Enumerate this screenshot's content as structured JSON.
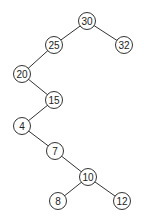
{
  "diagram": {
    "type": "binary-tree",
    "nodes": [
      {
        "id": "n30",
        "label": "30",
        "x": 87,
        "y": 21
      },
      {
        "id": "n25",
        "label": "25",
        "x": 54,
        "y": 45
      },
      {
        "id": "n32",
        "label": "32",
        "x": 124,
        "y": 45
      },
      {
        "id": "n20",
        "label": "20",
        "x": 22,
        "y": 74
      },
      {
        "id": "n15",
        "label": "15",
        "x": 54,
        "y": 100
      },
      {
        "id": "n4",
        "label": "4",
        "x": 22,
        "y": 126
      },
      {
        "id": "n7",
        "label": "7",
        "x": 55,
        "y": 151
      },
      {
        "id": "n10",
        "label": "10",
        "x": 88,
        "y": 177
      },
      {
        "id": "n8",
        "label": "8",
        "x": 58,
        "y": 201
      },
      {
        "id": "n12",
        "label": "12",
        "x": 122,
        "y": 201
      }
    ],
    "edges": [
      [
        "n30",
        "n25"
      ],
      [
        "n30",
        "n32"
      ],
      [
        "n25",
        "n20"
      ],
      [
        "n20",
        "n15"
      ],
      [
        "n15",
        "n4"
      ],
      [
        "n4",
        "n7"
      ],
      [
        "n7",
        "n10"
      ],
      [
        "n10",
        "n8"
      ],
      [
        "n10",
        "n12"
      ]
    ]
  }
}
